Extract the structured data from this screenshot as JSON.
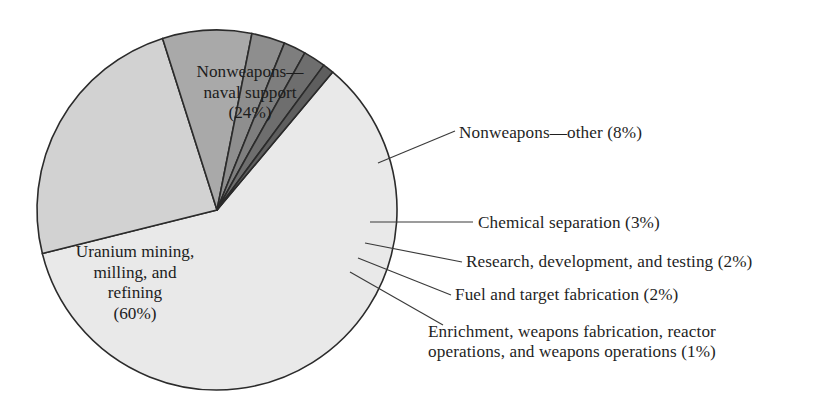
{
  "chart_data": {
    "type": "pie",
    "title": "",
    "subtitle": "",
    "xlabel": "",
    "ylabel": "",
    "legend_position": "callout-labels",
    "grid": false,
    "units": "percent",
    "total": 100,
    "center": {
      "x": 217,
      "y": 210
    },
    "radius": 180,
    "start_angle_deg": -50,
    "direction": "clockwise",
    "categories": [
      "Uranium mining, milling, and refining",
      "Nonweapons—naval support",
      "Nonweapons—other",
      "Chemical separation",
      "Research, development, and testing",
      "Fuel and target fabrication",
      "Enrichment, weapons fabrication, reactor operations, and weapons operations"
    ],
    "values": [
      60,
      24,
      8,
      3,
      2,
      2,
      1
    ],
    "colors": [
      "#e9e9e9",
      "#d2d2d2",
      "#a9a9a9",
      "#8e8e8e",
      "#7e7e7e",
      "#6e6e6e",
      "#5e5e5e"
    ],
    "slices": [
      {
        "name": "uranium-mining",
        "label": "Uranium mining, milling, and refining",
        "value": 60,
        "value_text": "(60%)",
        "color": "#e9e9e9",
        "label_placement": "inside"
      },
      {
        "name": "nonweapons-naval-support",
        "label": "Nonweapons—naval support",
        "value": 24,
        "value_text": "(24%)",
        "color": "#d2d2d2",
        "label_placement": "inside"
      },
      {
        "name": "nonweapons-other",
        "label": "Nonweapons—other (8%)",
        "value": 8,
        "value_text": "(8%)",
        "color": "#a9a9a9",
        "label_placement": "callout"
      },
      {
        "name": "chemical-separation",
        "label": "Chemical separation (3%)",
        "value": 3,
        "value_text": "(3%)",
        "color": "#8e8e8e",
        "label_placement": "callout"
      },
      {
        "name": "research-development-testing",
        "label": "Research, development, and testing (2%)",
        "value": 2,
        "value_text": "(2%)",
        "color": "#7e7e7e",
        "label_placement": "callout"
      },
      {
        "name": "fuel-and-target-fabrication",
        "label": "Fuel and target fabrication (2%)",
        "value": 2,
        "value_text": "(2%)",
        "color": "#6e6e6e",
        "label_placement": "callout"
      },
      {
        "name": "enrichment-weapons-fabrication",
        "label": "Enrichment, weapons fabrication, reactor operations, and weapons operations (1%)",
        "value": 1,
        "value_text": "(1%)",
        "color": "#5e5e5e",
        "label_placement": "callout"
      }
    ]
  },
  "labels": {
    "naval_line1": "Nonweapons—",
    "naval_line2": "naval support",
    "naval_line3": "(24%)",
    "uranium_line1": "Uranium mining,",
    "uranium_line2": "milling, and",
    "uranium_line3": "refining",
    "uranium_line4": "(60%)",
    "nonweapons_other": "Nonweapons—other (8%)",
    "chemical_separation": "Chemical separation (3%)",
    "research_development_testing": "Research, development, and testing (2%)",
    "fuel_target_fabrication": "Fuel and target fabrication (2%)",
    "enrichment_line1": "Enrichment, weapons fabrication, reactor",
    "enrichment_line2": "operations, and weapons operations (1%)"
  },
  "style": {
    "background": "#ffffff",
    "outline": "#2b2b2b",
    "text": "#1c1c1c",
    "leader": "#3a3a3a"
  }
}
